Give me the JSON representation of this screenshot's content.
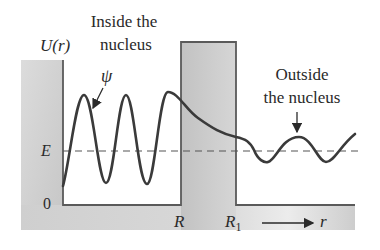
{
  "diagram": {
    "labels": {
      "y_axis": "U(r)",
      "inside_line1": "Inside the",
      "inside_line2": "nucleus",
      "outside_line1": "Outside",
      "outside_line2": "the nucleus",
      "psi": "ψ",
      "energy": "E",
      "zero": "0",
      "R": "R",
      "R1_main": "R",
      "R1_sub": "1",
      "r_axis": "r"
    },
    "colors": {
      "background": "#ffffff",
      "barrier_fill": "#c9c9c9",
      "barrier_fill_light": "#e2e2e2",
      "outline": "#5a5a5a",
      "wave": "#3a3a3a",
      "dashed_line": "#555555",
      "text": "#2a2a2a"
    }
  }
}
